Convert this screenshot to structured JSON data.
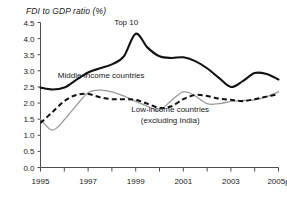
{
  "chart_data": {
    "type": "line",
    "title": "FDI to GDP ratio (%)",
    "xlabel": "",
    "ylabel": "",
    "ylim": [
      0.0,
      4.5
    ],
    "xlim": [
      1995,
      2005
    ],
    "grid": false,
    "legend_position": "inline-annotations",
    "y_ticks": [
      "0.0",
      "0.5",
      "1.0",
      "1.5",
      "2.0",
      "2.5",
      "3.0",
      "3.5",
      "4.0",
      "4.5"
    ],
    "y_tick_values": [
      0.0,
      0.5,
      1.0,
      1.5,
      2.0,
      2.5,
      3.0,
      3.5,
      4.0,
      4.5
    ],
    "x_ticks": [
      "1995",
      "",
      "1997",
      "",
      "1999",
      "",
      "2001",
      "",
      "2003",
      "",
      "2005p"
    ],
    "x_tick_values": [
      1995,
      1996,
      1997,
      1998,
      1999,
      2000,
      2001,
      2002,
      2003,
      2004,
      2005
    ],
    "x": [
      1995,
      1995.5,
      1996,
      1996.5,
      1997,
      1997.5,
      1998,
      1998.5,
      1999,
      1999.5,
      2000,
      2000.5,
      2001,
      2001.5,
      2002,
      2002.5,
      2003,
      2003.5,
      2004,
      2004.5,
      2005
    ],
    "series": [
      {
        "name": "Top 10",
        "style": "solid-black-thick",
        "color": "#111111",
        "label_x": 1998.6,
        "label_y": 4.42,
        "values": [
          2.48,
          2.42,
          2.48,
          2.72,
          2.95,
          3.08,
          3.2,
          3.45,
          4.15,
          3.72,
          3.45,
          3.4,
          3.42,
          3.3,
          3.08,
          2.78,
          2.5,
          2.68,
          2.93,
          2.9,
          2.73
        ]
      },
      {
        "name": "Middle-income countries",
        "style": "solid-gray-thin",
        "color": "#9a9a9a",
        "label_x": 1997.55,
        "label_y": 2.78,
        "values": [
          1.5,
          1.16,
          1.48,
          1.92,
          2.32,
          2.4,
          2.35,
          2.22,
          2.05,
          1.9,
          1.78,
          2.08,
          2.35,
          2.22,
          1.98,
          1.98,
          2.05,
          2.08,
          2.1,
          2.2,
          2.35
        ]
      },
      {
        "name": "Low-income countries (excluding India)",
        "style": "dashed-black",
        "color": "#111111",
        "label_x": 2000.45,
        "label_y": 1.72,
        "label_line2": "(excluding India)",
        "values": [
          1.38,
          1.72,
          2.06,
          2.25,
          2.28,
          2.18,
          2.12,
          2.12,
          2.1,
          1.98,
          1.85,
          1.9,
          2.12,
          2.25,
          2.22,
          2.14,
          2.1,
          2.06,
          2.12,
          2.2,
          2.28
        ]
      }
    ]
  },
  "annotations": {
    "top10": "Top 10",
    "middle": "Middle-income countries",
    "low_line1": "Low-income countries",
    "low_line2": "(excluding India)"
  }
}
